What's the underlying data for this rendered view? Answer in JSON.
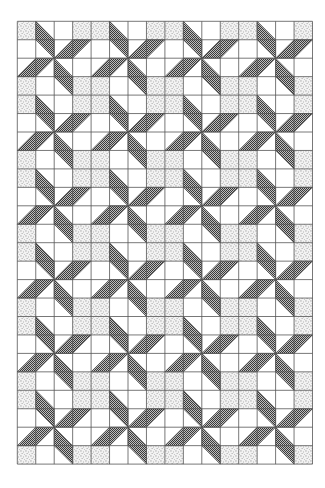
{
  "figure": {
    "grid": {
      "left": 17.3,
      "top": 21.3,
      "cell": 18.45,
      "cols": 16,
      "rows": 24,
      "line_color": "#555555",
      "background": "#ffffff"
    },
    "repeat_unit": {
      "size": 4,
      "pinwheel_center": [
        2,
        2
      ],
      "blades": [
        [
          [
            1,
            0
          ],
          [
            2,
            1
          ],
          [
            2,
            2
          ],
          [
            1,
            1
          ]
        ],
        [
          [
            2,
            2
          ],
          [
            3,
            1
          ],
          [
            4,
            1
          ],
          [
            3,
            2
          ]
        ],
        [
          [
            2,
            2
          ],
          [
            3,
            3
          ],
          [
            3,
            4
          ],
          [
            2,
            3
          ]
        ],
        [
          [
            0,
            3
          ],
          [
            1,
            2
          ],
          [
            2,
            2
          ],
          [
            1,
            3
          ]
        ]
      ],
      "stippled_cells": [
        [
          0,
          0
        ],
        [
          3,
          0
        ],
        [
          0,
          3
        ],
        [
          3,
          3
        ]
      ]
    },
    "colors": {
      "blade_dark": "#3a3a3a",
      "blade_light": "#bdbdbd",
      "stipple_dot": "#6a6a6a",
      "stipple_bg": "#f2f2f2"
    }
  }
}
